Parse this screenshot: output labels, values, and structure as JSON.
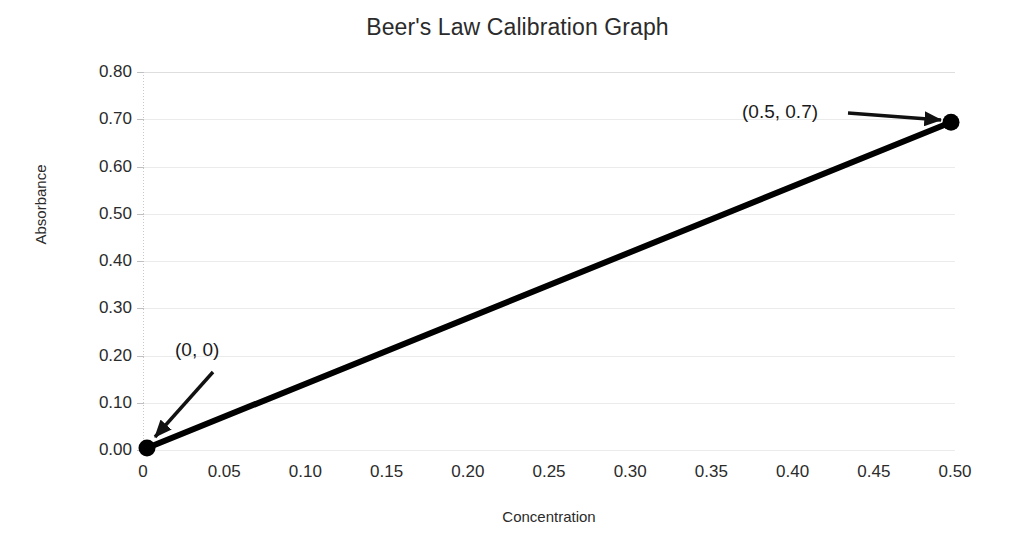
{
  "chart_data": {
    "type": "line",
    "title": "Beer's Law Calibration Graph",
    "xlabel": "Concentration",
    "ylabel": "Absorbance",
    "xlim": [
      0,
      0.5
    ],
    "ylim": [
      0,
      0.8
    ],
    "grid": true,
    "legend": null,
    "x": [
      0,
      0.5
    ],
    "values": [
      0,
      0.7
    ],
    "series": [
      {
        "name": "Calibration line",
        "x": [
          0,
          0.5
        ],
        "values": [
          0,
          0.7
        ],
        "color": "#000000",
        "marker": "filled-circle",
        "linewidth": 6
      }
    ],
    "xticks": [
      0,
      0.05,
      0.1,
      0.15,
      0.2,
      0.25,
      0.3,
      0.35,
      0.4,
      0.45,
      0.5
    ],
    "xticklabels": [
      "0",
      "0.05",
      "0.10",
      "0.15",
      "0.20",
      "0.25",
      "0.30",
      "0.35",
      "0.40",
      "0.45",
      "0.50"
    ],
    "yticks": [
      0,
      0.1,
      0.2,
      0.3,
      0.4,
      0.5,
      0.6,
      0.7,
      0.8
    ],
    "yticklabels": [
      "0.00",
      "0.10",
      "0.20",
      "0.30",
      "0.40",
      "0.50",
      "0.60",
      "0.70",
      "0.80"
    ],
    "annotations": [
      {
        "text": "(0, 0)",
        "points_to_x": 0,
        "points_to_y": 0,
        "arrow": "down-left"
      },
      {
        "text": "(0.5, 0.7)",
        "points_to_x": 0.5,
        "points_to_y": 0.7,
        "arrow": "right"
      }
    ]
  },
  "colors": {
    "line": "#000000",
    "marker": "#000000",
    "grid": "#ebebeb",
    "axis": "#c9c9c9",
    "text": "#2b2b2b",
    "background": "#ffffff"
  },
  "annotation_labels": {
    "origin": "(0, 0)",
    "endpoint": "(0.5, 0.7)"
  }
}
